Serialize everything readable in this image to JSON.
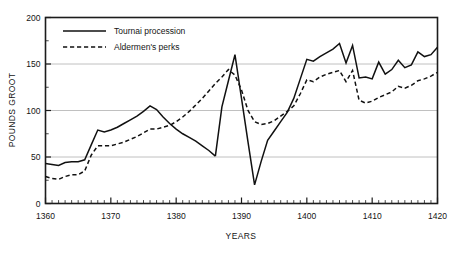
{
  "chart_data": {
    "type": "line",
    "title": "",
    "xlabel": "YEARS",
    "ylabel": "POUNDS GROOT",
    "xlim": [
      1360,
      1420
    ],
    "ylim": [
      0,
      200
    ],
    "xticks": [
      1360,
      1370,
      1380,
      1390,
      1400,
      1410,
      1420
    ],
    "xtick_labels": [
      "1360",
      "1370",
      "1380",
      "1390",
      "1400",
      "1410",
      "1420"
    ],
    "yticks": [
      0,
      50,
      100,
      150,
      200
    ],
    "ytick_labels": [
      "0",
      "50",
      "100",
      "150",
      "200"
    ],
    "x_minor_step": 1,
    "y_minor_step": 25,
    "grid": "horizontal-major",
    "gridline_values": [
      50,
      100,
      150
    ],
    "legend_position": "top-left-inside",
    "series": [
      {
        "name": "Tournai procession",
        "style": "solid",
        "color": "#111111",
        "points": [
          [
            1360,
            43
          ],
          [
            1361,
            42
          ],
          [
            1362,
            41
          ],
          [
            1363,
            44
          ],
          [
            1364,
            45
          ],
          [
            1365,
            45
          ],
          [
            1366,
            47
          ],
          [
            1367,
            63
          ],
          [
            1368,
            79
          ],
          [
            1369,
            77
          ],
          [
            1370,
            79
          ],
          [
            1371,
            82
          ],
          [
            1372,
            86
          ],
          [
            1373,
            90
          ],
          [
            1374,
            94
          ],
          [
            1375,
            99
          ],
          [
            1376,
            105
          ],
          [
            1377,
            101
          ],
          [
            1378,
            93
          ],
          [
            1379,
            86
          ],
          [
            1380,
            80
          ],
          [
            1381,
            75
          ],
          [
            1382,
            71
          ],
          [
            1383,
            67
          ],
          [
            1384,
            62
          ],
          [
            1385,
            57
          ],
          [
            1386,
            51
          ]
        ]
      },
      {
        "name": "Tournai procession",
        "style": "solid",
        "color": "#111111",
        "segment": 2,
        "points": [
          [
            1386,
            51
          ],
          [
            1387,
            104
          ],
          [
            1388,
            132
          ],
          [
            1389,
            160
          ],
          [
            1390,
            113
          ],
          [
            1391,
            66
          ],
          [
            1392,
            20
          ],
          [
            1393,
            45
          ],
          [
            1394,
            68
          ],
          [
            1395,
            78
          ],
          [
            1396,
            88
          ],
          [
            1397,
            98
          ],
          [
            1398,
            113
          ],
          [
            1399,
            134
          ],
          [
            1400,
            155
          ],
          [
            1401,
            153
          ],
          [
            1402,
            158
          ],
          [
            1403,
            162
          ],
          [
            1404,
            166
          ],
          [
            1405,
            172
          ],
          [
            1406,
            151
          ],
          [
            1407,
            170
          ],
          [
            1408,
            135
          ],
          [
            1409,
            136
          ],
          [
            1410,
            134
          ],
          [
            1411,
            152
          ],
          [
            1412,
            139
          ],
          [
            1413,
            144
          ],
          [
            1414,
            154
          ],
          [
            1415,
            146
          ],
          [
            1416,
            149
          ],
          [
            1417,
            163
          ],
          [
            1418,
            158
          ],
          [
            1419,
            160
          ],
          [
            1420,
            168
          ]
        ]
      },
      {
        "name": "Aldermen's perks",
        "style": "dashed",
        "color": "#111111",
        "points": [
          [
            1360,
            29
          ],
          [
            1361,
            27
          ],
          [
            1362,
            26
          ],
          [
            1363,
            29
          ],
          [
            1364,
            31
          ],
          [
            1365,
            31
          ],
          [
            1366,
            35
          ],
          [
            1367,
            52
          ],
          [
            1368,
            62
          ],
          [
            1369,
            62
          ],
          [
            1370,
            62
          ],
          [
            1371,
            64
          ],
          [
            1372,
            66
          ],
          [
            1373,
            69
          ],
          [
            1374,
            72
          ],
          [
            1375,
            76
          ],
          [
            1376,
            80
          ],
          [
            1377,
            80
          ],
          [
            1378,
            82
          ],
          [
            1379,
            84
          ],
          [
            1380,
            88
          ],
          [
            1381,
            93
          ],
          [
            1382,
            99
          ],
          [
            1383,
            106
          ],
          [
            1384,
            113
          ],
          [
            1385,
            121
          ],
          [
            1386,
            129
          ],
          [
            1387,
            136
          ],
          [
            1388,
            144
          ],
          [
            1389,
            138
          ],
          [
            1390,
            122
          ],
          [
            1391,
            100
          ],
          [
            1392,
            88
          ],
          [
            1393,
            85
          ],
          [
            1394,
            86
          ],
          [
            1395,
            89
          ],
          [
            1396,
            94
          ],
          [
            1397,
            99
          ],
          [
            1398,
            105
          ],
          [
            1399,
            118
          ],
          [
            1400,
            133
          ],
          [
            1401,
            131
          ],
          [
            1402,
            136
          ],
          [
            1403,
            139
          ],
          [
            1404,
            141
          ],
          [
            1405,
            143
          ],
          [
            1406,
            131
          ],
          [
            1407,
            143
          ],
          [
            1408,
            111
          ],
          [
            1409,
            108
          ],
          [
            1410,
            110
          ],
          [
            1411,
            114
          ],
          [
            1412,
            117
          ],
          [
            1413,
            120
          ],
          [
            1414,
            126
          ],
          [
            1415,
            124
          ],
          [
            1416,
            127
          ],
          [
            1417,
            132
          ],
          [
            1418,
            134
          ],
          [
            1419,
            137
          ],
          [
            1420,
            141
          ]
        ]
      }
    ],
    "legend": [
      {
        "label": "Tournai procession",
        "style": "solid"
      },
      {
        "label": "Aldermen's perks",
        "style": "dashed"
      }
    ]
  },
  "colors": {
    "frame": "#1c1c1c",
    "grid": "#b9b9b9",
    "line": "#111111",
    "background": "#ffffff"
  }
}
